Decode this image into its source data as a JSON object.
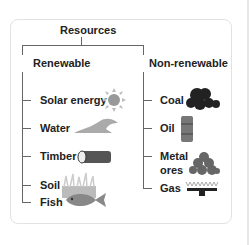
{
  "root": {
    "label": "Resources"
  },
  "renewable": {
    "label": "Renewable",
    "items": [
      {
        "label": "Solar energy",
        "icon": "sun-icon"
      },
      {
        "label": "Water",
        "icon": "wave-icon"
      },
      {
        "label": "Timber",
        "icon": "log-icon"
      },
      {
        "label": "Soil",
        "icon": "grass-soil-icon"
      },
      {
        "label": "Fish",
        "icon": "fish-icon"
      }
    ]
  },
  "non_renewable": {
    "label": "Non-renewable",
    "items": [
      {
        "label": "Coal",
        "icon": "coal-icon"
      },
      {
        "label": "Oil",
        "icon": "oil-barrel-icon"
      },
      {
        "label": "Metal",
        "label2": "ores",
        "icon": "ore-pile-icon"
      },
      {
        "label": "Gas",
        "icon": "gas-burner-icon"
      }
    ]
  }
}
